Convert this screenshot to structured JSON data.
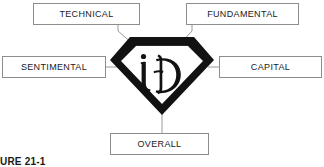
{
  "figure": {
    "caption": "URE 21-1",
    "emblem": {
      "shape_name": "diamond-shield",
      "monogram": "iD",
      "fill_color": "#121212",
      "background_color": "#ffffff"
    },
    "colors": {
      "box_border": "#8d8d8d",
      "connector_line": "#9a9a9a",
      "text": "#1a1a1a",
      "page_background": "#ffffff"
    },
    "nodes": [
      {
        "id": "technical",
        "label": "TECHNICAL"
      },
      {
        "id": "fundamental",
        "label": "FUNDAMENTAL"
      },
      {
        "id": "sentimental",
        "label": "SENTIMENTAL"
      },
      {
        "id": "capital",
        "label": "CAPITAL"
      },
      {
        "id": "overall",
        "label": "OVERALL"
      }
    ]
  }
}
